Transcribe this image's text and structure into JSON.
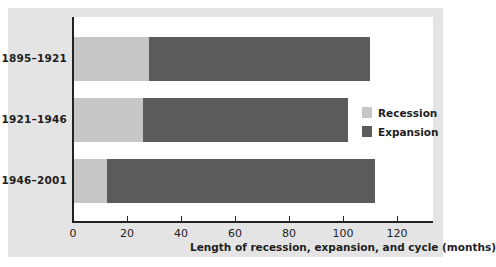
{
  "chart_data": {
    "type": "bar",
    "orientation": "horizontal",
    "stacked": true,
    "categories": [
      "1895–1921",
      "1921–1946",
      "1946–2001"
    ],
    "series": [
      {
        "name": "Recession",
        "values": [
          28,
          26,
          12.5
        ],
        "color": "#c6c6c6"
      },
      {
        "name": "Expansion",
        "values": [
          82,
          76,
          99.5
        ],
        "color": "#5b5b5b"
      }
    ],
    "title": "",
    "xlabel": "Length of recession, expansion, and cycle (months)",
    "ylabel": "",
    "xlim": [
      0,
      133
    ],
    "xticks": [
      0,
      20,
      40,
      60,
      80,
      100,
      120
    ],
    "grid": false,
    "legend_position": "right-center"
  },
  "axis": {
    "xlabel": "Length of recession, expansion, and cycle (months)",
    "ticks": [
      "0",
      "20",
      "40",
      "60",
      "80",
      "100",
      "120"
    ]
  },
  "rows": [
    {
      "label": "1895–1921"
    },
    {
      "label": "1921–1946"
    },
    {
      "label": "1946–2001"
    }
  ],
  "legend": {
    "items": [
      {
        "label": "Recession",
        "color": "#c6c6c6"
      },
      {
        "label": "Expansion",
        "color": "#5b5b5b"
      }
    ]
  }
}
